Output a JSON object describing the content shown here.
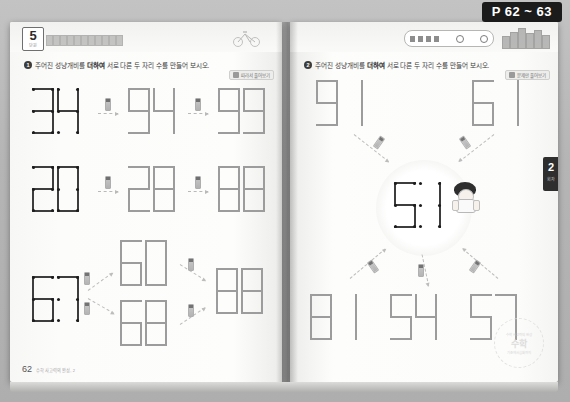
{
  "scan": {
    "page_chip": "P 62 ~ 63"
  },
  "left_page": {
    "unit_number": "5",
    "unit_sub": "단원",
    "instruction": {
      "q_number": "1",
      "before": "주어진 성냥개비를",
      "bold": "더하여",
      "after": "서로 다른 두 자리 수를 만들어 보시오."
    },
    "help_chip": "따라서 풀어보기",
    "rows": [
      {
        "start": "34",
        "step1": "94",
        "step2": "99"
      },
      {
        "start": "20",
        "step1": "28",
        "step2": "88"
      },
      {
        "start": "67",
        "branch_top": "60",
        "branch_bottom": "68",
        "result": "88"
      }
    ],
    "page_number": "62",
    "footer_note": "수학 사고력의 완성, 2"
  },
  "right_page": {
    "side_tab_number": "2",
    "side_tab_sub": "회차",
    "instruction": {
      "q_number": "2",
      "before": "주어진 성냥개비를",
      "bold": "더하여",
      "after": "서로 다른 두 자리 수를 만들어 보시오."
    },
    "help_chip": "문제만 풀어보기",
    "top_numbers": [
      "91",
      "61"
    ],
    "center_number": "51",
    "bottom_numbers": [
      "81",
      "54",
      "57"
    ],
    "seal_top": "수학 사고력의 완성",
    "seal_center": "수학",
    "seal_bottom": "기초에서 심화까지"
  }
}
